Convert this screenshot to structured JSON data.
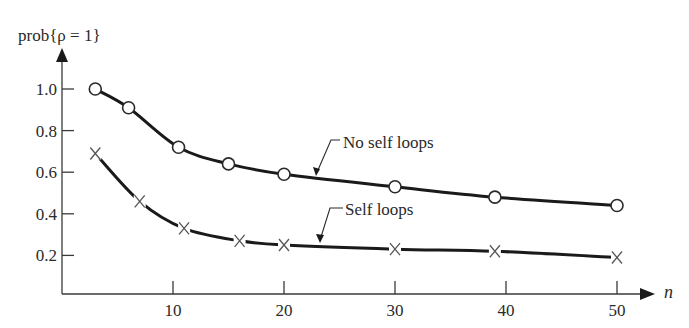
{
  "chart_data": {
    "type": "line",
    "title": "prob{ρ = 1}",
    "xlabel": "n",
    "ylabel": "prob{ρ = 1}",
    "xlim": [
      0,
      54
    ],
    "ylim": [
      0,
      1.15
    ],
    "x_ticks": [
      10,
      20,
      30,
      40,
      50
    ],
    "x_tick_labels": [
      "10",
      "20",
      "30",
      "40",
      "50"
    ],
    "y_ticks": [
      0.2,
      0.4,
      0.6,
      0.8,
      1.0
    ],
    "y_tick_labels": [
      "0.2",
      "0.4",
      "0.6",
      "0.8",
      "1.0"
    ],
    "grid": false,
    "legend": "inline annotations with leader arrows",
    "series": [
      {
        "name": "No self loops",
        "marker": "circle",
        "x": [
          3,
          6,
          10.5,
          15,
          20,
          30,
          39,
          50
        ],
        "values": [
          1.0,
          0.91,
          0.72,
          0.64,
          0.59,
          0.53,
          0.48,
          0.44
        ]
      },
      {
        "name": "Self loops",
        "marker": "cross",
        "x": [
          3,
          7,
          11,
          16,
          20,
          30,
          39,
          50
        ],
        "values": [
          0.69,
          0.46,
          0.33,
          0.27,
          0.25,
          0.23,
          0.22,
          0.19
        ]
      }
    ],
    "annotations": [
      {
        "text": "No self loops",
        "points_to_series": "No self loops",
        "at_x": 23
      },
      {
        "text": "Self loops",
        "points_to_series": "Self loops",
        "at_x": 23.5
      }
    ]
  },
  "labels": {
    "y_axis_title": "prob{ρ = 1}",
    "x_axis_title": "n",
    "annotation_no_self_loops": "No self loops",
    "annotation_self_loops": "Self loops"
  }
}
